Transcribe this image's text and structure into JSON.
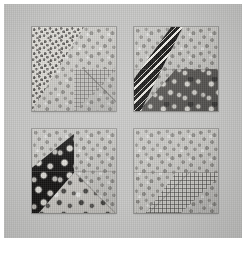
{
  "image": {
    "subject": "four-block patchwork quilt sampler photograph",
    "width": 246,
    "height": 260,
    "paper_margin_color": "#ffffff",
    "mat_color": "#c3c3c1",
    "mat_label": "gray linen quilt background"
  },
  "quilt": {
    "layout": "2 x 2 blocks",
    "block_count": 4,
    "sashing_color": "#c3c3c1",
    "blocks": [
      {
        "position": "top-left",
        "name": "block-top-left",
        "background_fabric": "light gray tossed floral",
        "background_color": "#c9c8c4",
        "patches": [
          {
            "name": "dot-print-triangle",
            "fabric": "white ground with dense dark pin dots",
            "color": "#dedcd6",
            "shape": "upper-left diagonal triangle"
          },
          {
            "name": "plaid-triangle",
            "fabric": "soft gray graph plaid",
            "color": "#cbcac6",
            "shape": "lower-right quarter square"
          },
          {
            "name": "floral-triangle",
            "fabric": "light gray tossed floral",
            "color": "#c9c8c4",
            "shape": "right half"
          }
        ]
      },
      {
        "position": "top-right",
        "name": "block-top-right",
        "background_fabric": "light gray tossed floral",
        "background_color": "#c9c8c4",
        "patches": [
          {
            "name": "chevron-band",
            "fabric": "black and white zigzag chevron stripe",
            "color": "#171615",
            "shape": "diagonal band upper-left"
          },
          {
            "name": "dark-floral-triangle",
            "fabric": "charcoal ground with pale floral sprigs",
            "color": "#5a5855",
            "shape": "lower-right triangle"
          },
          {
            "name": "floral-corner",
            "fabric": "light gray tossed floral",
            "color": "#c9c8c4",
            "shape": "upper-right corner"
          }
        ]
      },
      {
        "position": "bottom-left",
        "name": "block-bottom-left",
        "background_fabric": "light gray tossed floral",
        "background_color": "#c9c8c4",
        "patches": [
          {
            "name": "black-floral-triangle",
            "fabric": "black ground with white floral clusters",
            "color": "#151413",
            "shape": "left diagonal wedge"
          },
          {
            "name": "mid-floral-triangle",
            "fabric": "light floral with dark blooms",
            "color": "#cfcdc8",
            "shape": "lower-right triangle"
          },
          {
            "name": "floral-corner",
            "fabric": "light gray tossed floral",
            "color": "#c9c8c4",
            "shape": "upper-right corner"
          }
        ]
      },
      {
        "position": "bottom-right",
        "name": "block-bottom-right",
        "background_fabric": "light gray tossed floral",
        "background_color": "#c9c8c4",
        "patches": [
          {
            "name": "gingham-triangle",
            "fabric": "fine gray gingham check",
            "color": "#d3d2ce",
            "shape": "lower-center triangle"
          },
          {
            "name": "floral-field",
            "fabric": "light gray tossed floral",
            "color": "#c9c8c4",
            "shape": "upper three quarters"
          }
        ]
      }
    ]
  }
}
